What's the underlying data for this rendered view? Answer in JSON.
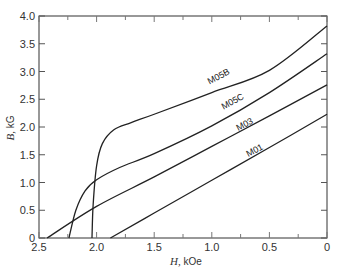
{
  "chart_data": {
    "type": "line",
    "title": "",
    "xlabel": "H, kOe",
    "ylabel": "B, kG",
    "xlim": [
      2.5,
      0
    ],
    "ylim": [
      0,
      4.0
    ],
    "x_reversed": true,
    "grid": false,
    "legend": "inline labels on curves",
    "x_ticks": [
      "2.5",
      "2.0",
      "1.5",
      "1.0",
      "0.5",
      "0"
    ],
    "y_ticks": [
      "0",
      "0.5",
      "1.0",
      "1.5",
      "2.0",
      "2.5",
      "3.0",
      "3.5",
      "4.0"
    ],
    "series": [
      {
        "name": "M05B",
        "points": [
          [
            2.04,
            0
          ],
          [
            2.03,
            0.6
          ],
          [
            2.0,
            1.3
          ],
          [
            1.95,
            1.7
          ],
          [
            1.85,
            1.95
          ],
          [
            1.7,
            2.08
          ],
          [
            1.5,
            2.23
          ],
          [
            1.0,
            2.62
          ],
          [
            0.5,
            3.02
          ],
          [
            0,
            3.82
          ]
        ]
      },
      {
        "name": "M05C",
        "points": [
          [
            2.24,
            0
          ],
          [
            2.18,
            0.5
          ],
          [
            2.1,
            0.85
          ],
          [
            2.0,
            1.05
          ],
          [
            1.8,
            1.27
          ],
          [
            1.5,
            1.52
          ],
          [
            1.0,
            2.02
          ],
          [
            0.5,
            2.62
          ],
          [
            0,
            3.32
          ]
        ]
      },
      {
        "name": "M03",
        "points": [
          [
            2.43,
            0
          ],
          [
            2.0,
            0.57
          ],
          [
            1.5,
            1.1
          ],
          [
            1.0,
            1.65
          ],
          [
            0.5,
            2.2
          ],
          [
            0,
            2.76
          ]
        ]
      },
      {
        "name": "M01",
        "points": [
          [
            1.88,
            0
          ],
          [
            1.5,
            0.45
          ],
          [
            1.0,
            1.04
          ],
          [
            0.5,
            1.63
          ],
          [
            0,
            2.23
          ]
        ]
      }
    ]
  },
  "labels": {
    "xlabel_italic": "H,",
    "xlabel_unit": " kOe",
    "ylabel_italic": "B,",
    "ylabel_unit": " kG"
  }
}
